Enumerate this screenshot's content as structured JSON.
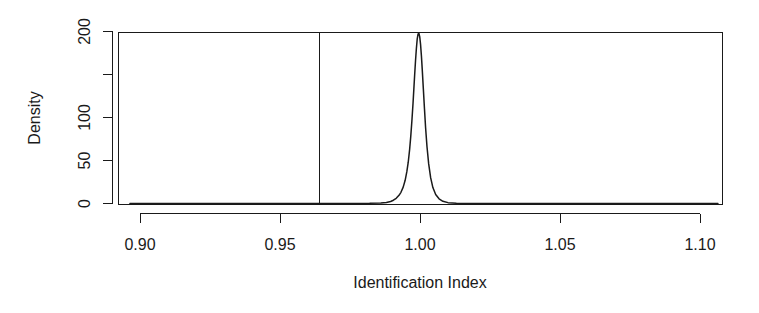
{
  "chart_data": {
    "type": "line",
    "title": "",
    "subtitle": "",
    "xlabel": "Identification Index",
    "ylabel": "Density",
    "xlim": [
      0.8964,
      1.1064
    ],
    "ylim": [
      0,
      208
    ],
    "grid": false,
    "legend": null,
    "x_ticks": [
      0.9,
      0.95,
      1.0,
      1.05,
      1.1
    ],
    "x_tick_labels": [
      "0.90",
      "0.95",
      "1.00",
      "1.05",
      "1.10"
    ],
    "y_ticks": [
      0,
      50,
      100,
      150,
      200
    ],
    "y_tick_labels": [
      "0",
      "50",
      "100",
      "150",
      "200"
    ],
    "y_tick_labels_shown": [
      "0",
      "50",
      "100",
      "",
      "200"
    ],
    "series": [
      {
        "name": "Density",
        "type": "line",
        "x": [
          0.8964,
          0.93,
          0.95,
          0.964,
          0.975,
          0.982,
          0.986,
          0.988,
          0.9895,
          0.9905,
          0.9915,
          0.9925,
          0.9932,
          0.994,
          0.9947,
          0.9953,
          0.9958,
          0.9963,
          0.9967,
          0.9971,
          0.9975,
          0.9978,
          0.9981,
          0.9984,
          0.9987,
          0.999,
          0.9993,
          0.9996,
          0.9999,
          1.0002,
          1.0005,
          1.0008,
          1.0012,
          1.0016,
          1.002,
          1.0025,
          1.0031,
          1.0038,
          1.0046,
          1.0056,
          1.0068,
          1.0082,
          1.01,
          1.013,
          1.02,
          1.04,
          1.07,
          1.1064
        ],
        "y": [
          0,
          0,
          0,
          0,
          0,
          0.2,
          0.6,
          1.2,
          2.4,
          3.8,
          6.0,
          9.5,
          13.0,
          19.0,
          27.0,
          37.0,
          48.0,
          63.0,
          78.0,
          96.0,
          116.0,
          133.0,
          150.0,
          166.0,
          180.0,
          191.0,
          197.0,
          198.0,
          194.0,
          185.0,
          172.0,
          156.0,
          133.0,
          110.0,
          88.0,
          66.0,
          46.0,
          30.0,
          18.5,
          10.5,
          5.5,
          2.6,
          1.0,
          0.3,
          0.05,
          0,
          0,
          0
        ]
      }
    ],
    "annotations": [
      {
        "name": "vertical-reference-line",
        "type": "vline",
        "x": 0.964,
        "y_from": 0,
        "y_to": 208
      }
    ]
  },
  "figure": {
    "background_color": "#ffffff",
    "foreground_color": "#1a1a1a"
  }
}
